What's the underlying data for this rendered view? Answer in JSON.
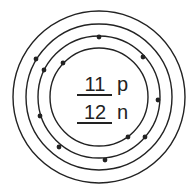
{
  "diagram": {
    "type": "bohr-model",
    "center": [
      99,
      97
    ],
    "stroke_color": "#222222",
    "shells": [
      {
        "radius": 49,
        "electrons": 2,
        "positions": [
          [
            63,
            63
          ],
          [
            128,
            137
          ]
        ]
      },
      {
        "radius": 61,
        "electrons": 8,
        "positions": [
          [
            99,
            37
          ],
          [
            143,
            57
          ],
          [
            44,
            70
          ],
          [
            158,
            100
          ],
          [
            40,
            116
          ],
          [
            145,
            137
          ],
          [
            59,
            147
          ],
          [
            105,
            160
          ]
        ]
      },
      {
        "radius": 73,
        "electrons": 1,
        "positions": [
          [
            36,
            59
          ]
        ]
      },
      {
        "radius": 86,
        "electrons": 0,
        "positions": []
      }
    ],
    "nucleus": {
      "protons_value": "11",
      "protons_unit": "p",
      "neutrons_value": "12",
      "neutrons_unit": "n"
    }
  }
}
